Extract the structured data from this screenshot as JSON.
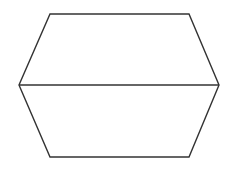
{
  "diagram": {
    "type": "hexagon-with-diagonal",
    "stroke_color": "#333333",
    "background": "#ffffff",
    "vertices": {
      "top_left": [
        50,
        14
      ],
      "top_right": [
        189,
        14
      ],
      "right": [
        219,
        85
      ],
      "bottom_right": [
        189,
        157
      ],
      "bottom_left": [
        50,
        157
      ],
      "left": [
        19,
        85
      ]
    },
    "diagonal": {
      "from": "left",
      "to": "right"
    }
  }
}
